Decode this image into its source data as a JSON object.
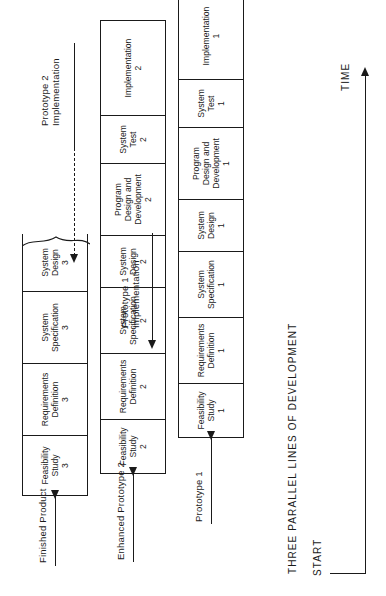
{
  "diagram": {
    "title": "THREE PARALLEL LINES OF DEVELOPMENT",
    "axis": {
      "start_label": "START",
      "time_label": "TIME"
    },
    "outputs": {
      "finished_product": "Finished Product",
      "enhanced_prototype_2": "Enhanced Prototype 2",
      "prototype_1": "Prototype 1"
    },
    "feedback": {
      "prototype_1_implementation": "Prototype 1\nImplementation",
      "prototype_1_implementation_l1": "Prototype 1",
      "prototype_1_implementation_l2": "Implementation",
      "prototype_2_implementation_l1": "Prototype 2",
      "prototype_2_implementation_l2": "Implementation"
    },
    "lines": [
      {
        "id": "line-3",
        "name": "Finished Product line",
        "truncated": true,
        "stages": [
          {
            "label": "Feasibility Study",
            "l1": "Feasibility",
            "l2": "Study",
            "num": "3"
          },
          {
            "label": "Requirements Definition",
            "l1": "Requirements",
            "l2": "Definition",
            "num": "3"
          },
          {
            "label": "System Specification",
            "l1": "System",
            "l2": "Specification",
            "num": "3"
          },
          {
            "label": "System Design",
            "l1": "System",
            "l2": "Design",
            "num": "3"
          }
        ]
      },
      {
        "id": "line-2",
        "name": "Enhanced Prototype 2 line",
        "truncated": false,
        "stages": [
          {
            "label": "Feasibility Study",
            "l1": "Feasibility",
            "l2": "Study",
            "num": "2"
          },
          {
            "label": "Requirements Definition",
            "l1": "Requirements",
            "l2": "Definition",
            "num": "2"
          },
          {
            "label": "System Specification",
            "l1": "System",
            "l2": "Specification",
            "num": "2"
          },
          {
            "label": "System Design",
            "l1": "System",
            "l2": "Design",
            "num": "2"
          },
          {
            "label": "Program Design and Development",
            "l1": "Program",
            "l2": "Design and",
            "l3": "Development",
            "num": "2"
          },
          {
            "label": "System Test",
            "l1": "System",
            "l2": "Test",
            "num": "2"
          },
          {
            "label": "Implementation",
            "l1": "Implementation",
            "num": "2"
          }
        ]
      },
      {
        "id": "line-1",
        "name": "Prototype 1 line",
        "truncated": false,
        "stages": [
          {
            "label": "Feasibility Study",
            "l1": "Feasibility",
            "l2": "Study",
            "num": "1"
          },
          {
            "label": "Requirements Definition",
            "l1": "Requirements",
            "l2": "Definition",
            "num": "1"
          },
          {
            "label": "System Specification",
            "l1": "System",
            "l2": "Specification",
            "num": "1"
          },
          {
            "label": "System Design",
            "l1": "System",
            "l2": "Design",
            "num": "1"
          },
          {
            "label": "Program Design and Development",
            "l1": "Program",
            "l2": "Design and",
            "l3": "Development",
            "num": "1"
          },
          {
            "label": "System Test",
            "l1": "System",
            "l2": "Test",
            "num": "1"
          },
          {
            "label": "Implementation",
            "l1": "Implementation",
            "num": "1"
          }
        ]
      }
    ]
  }
}
